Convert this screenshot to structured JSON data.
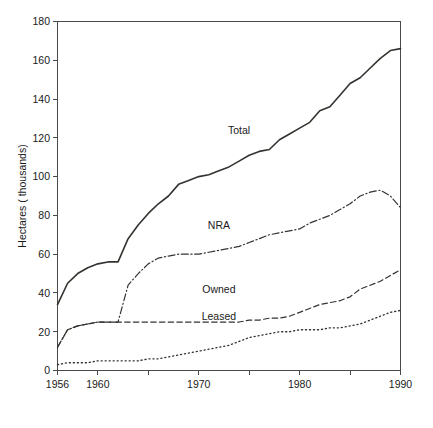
{
  "chart_data": {
    "type": "line",
    "title": "",
    "xlabel": "",
    "ylabel": "Hectares ( thousands)",
    "xlim": [
      1956,
      1990
    ],
    "ylim": [
      0,
      180
    ],
    "grid": false,
    "legend_position": "inline-labels",
    "x_ticks_major": [
      1956,
      1960,
      1970,
      1980,
      1990
    ],
    "x_ticks_minor": [
      1965,
      1975,
      1985
    ],
    "x_tick_labels": [
      "1956",
      "1960",
      "1970",
      "1980",
      "1990"
    ],
    "y_ticks": [
      0,
      20,
      40,
      60,
      80,
      100,
      120,
      140,
      160,
      180
    ],
    "y_tick_labels": [
      "0",
      "20",
      "40",
      "60",
      "80",
      "100",
      "120",
      "140",
      "160",
      "180"
    ],
    "x": [
      1956,
      1957,
      1958,
      1959,
      1960,
      1961,
      1962,
      1963,
      1964,
      1965,
      1966,
      1967,
      1968,
      1969,
      1970,
      1971,
      1972,
      1973,
      1974,
      1975,
      1976,
      1977,
      1978,
      1979,
      1980,
      1981,
      1982,
      1983,
      1984,
      1985,
      1986,
      1987,
      1988,
      1989,
      1990
    ],
    "series": [
      {
        "name": "Total",
        "style": "solid",
        "label_x": 1974,
        "label_y": 122,
        "values": [
          34,
          45,
          50,
          53,
          55,
          56,
          56,
          68,
          75,
          81,
          86,
          90,
          96,
          98,
          100,
          101,
          103,
          105,
          108,
          111,
          113,
          114,
          119,
          122,
          125,
          128,
          134,
          136,
          142,
          148,
          151,
          156,
          161,
          165,
          166
        ]
      },
      {
        "name": "NRA",
        "style": "dash-dot",
        "label_x": 1972,
        "label_y": 73,
        "values": [
          12,
          21,
          23,
          24,
          25,
          25,
          25,
          44,
          50,
          55,
          58,
          59,
          60,
          60,
          60,
          61,
          62,
          63,
          64,
          66,
          68,
          70,
          71,
          72,
          73,
          76,
          78,
          80,
          83,
          86,
          90,
          92,
          93,
          90,
          84
        ]
      },
      {
        "name": "Owned",
        "style": "dashed",
        "label_x": 1972,
        "label_y": 40,
        "values": [
          12,
          21,
          23,
          24,
          25,
          25,
          25,
          25,
          25,
          25,
          25,
          25,
          25,
          25,
          25,
          25,
          25,
          25,
          25,
          26,
          26,
          27,
          27,
          28,
          30,
          32,
          34,
          35,
          36,
          38,
          42,
          44,
          46,
          49,
          52
        ]
      },
      {
        "name": "Leased",
        "style": "dotted",
        "label_x": 1972,
        "label_y": 26,
        "values": [
          3,
          4,
          4,
          4,
          5,
          5,
          5,
          5,
          5,
          6,
          6,
          7,
          8,
          9,
          10,
          11,
          12,
          13,
          15,
          17,
          18,
          19,
          20,
          20,
          21,
          21,
          21,
          22,
          22,
          23,
          24,
          26,
          28,
          30,
          31
        ]
      }
    ]
  },
  "colors": {
    "axis": "#4a4a4a",
    "series": "#33332f",
    "background": "#ffffff",
    "text": "#1a1a1a"
  }
}
